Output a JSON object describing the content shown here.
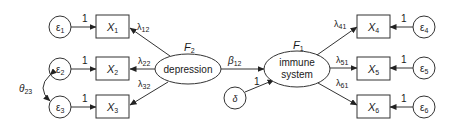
{
  "diagram": {
    "type": "structural-equation-model",
    "latent_factors": [
      {
        "id": "F2",
        "symbol": "F",
        "sub": "2",
        "label": "depression"
      },
      {
        "id": "F1",
        "symbol": "F",
        "sub": "1",
        "label_line1": "immune",
        "label_line2": "system"
      }
    ],
    "observed": [
      {
        "id": "X1",
        "symbol": "X",
        "sub": "1"
      },
      {
        "id": "X2",
        "symbol": "X",
        "sub": "2"
      },
      {
        "id": "X3",
        "symbol": "X",
        "sub": "3"
      },
      {
        "id": "X4",
        "symbol": "X",
        "sub": "4"
      },
      {
        "id": "X5",
        "symbol": "X",
        "sub": "5"
      },
      {
        "id": "X6",
        "symbol": "X",
        "sub": "6"
      }
    ],
    "errors": [
      {
        "id": "e1",
        "symbol": "ε",
        "sub": "1"
      },
      {
        "id": "e2",
        "symbol": "ε",
        "sub": "2"
      },
      {
        "id": "e3",
        "symbol": "ε",
        "sub": "3"
      },
      {
        "id": "e4",
        "symbol": "ε",
        "sub": "4"
      },
      {
        "id": "e5",
        "symbol": "ε",
        "sub": "5"
      },
      {
        "id": "e6",
        "symbol": "ε",
        "sub": "6"
      }
    ],
    "disturbance": {
      "symbol": "δ",
      "path_label": "1"
    },
    "loadings": [
      {
        "symbol": "λ",
        "sub": "12"
      },
      {
        "symbol": "λ",
        "sub": "22"
      },
      {
        "symbol": "λ",
        "sub": "32"
      },
      {
        "symbol": "λ",
        "sub": "41"
      },
      {
        "symbol": "λ",
        "sub": "51"
      },
      {
        "symbol": "λ",
        "sub": "61"
      }
    ],
    "structural_path": {
      "symbol": "β",
      "sub": "12"
    },
    "error_covariance": {
      "symbol": "θ",
      "sub": "23"
    },
    "error_path_label": "1"
  }
}
